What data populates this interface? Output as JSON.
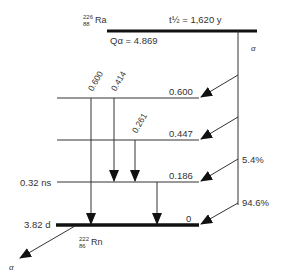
{
  "parent": {
    "mass": "226",
    "atomic": "88",
    "symbol": "Ra",
    "half_life": "t½ = 1,620 y",
    "q_value": "Qα = 4.869",
    "decay_label": "α"
  },
  "daughter": {
    "mass": "222",
    "atomic": "86",
    "symbol": "Rn",
    "half_life": "3.82 d",
    "decay_label": "α"
  },
  "levels": [
    {
      "energy": "0.600",
      "y": 98,
      "lifetime": ""
    },
    {
      "energy": "0.447",
      "y": 140,
      "lifetime": ""
    },
    {
      "energy": "0.186",
      "y": 182,
      "lifetime": "0.32 ns"
    },
    {
      "energy": "0",
      "y": 225,
      "lifetime": "3.82 d"
    }
  ],
  "alpha_branches": [
    {
      "to": "0.600",
      "intensity": ""
    },
    {
      "to": "0.447",
      "intensity": ""
    },
    {
      "to": "0.186",
      "intensity": "5.4%"
    },
    {
      "to": "0",
      "intensity": "94.6%"
    }
  ],
  "gamma_transitions": [
    {
      "energy": "0.600",
      "from": "0.600",
      "to": "0"
    },
    {
      "energy": "0.414",
      "from": "0.600",
      "to": "0.186"
    },
    {
      "energy": "0.261",
      "from": "0.447",
      "to": "0.186"
    },
    {
      "energy": "",
      "from": "0.186",
      "to": "0"
    }
  ]
}
